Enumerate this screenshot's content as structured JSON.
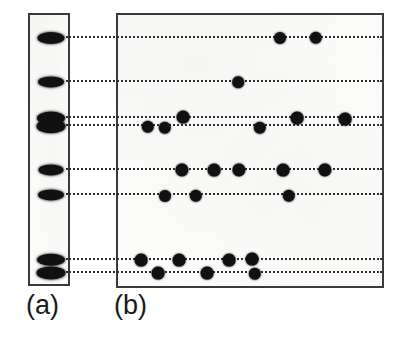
{
  "figure": {
    "type": "gel-electrophoresis-comparison",
    "background_color": "#ffffff",
    "panel_fill": "#fbfbfa",
    "panel_border_color": "#3a3a3a",
    "spot_color": "#111111",
    "trace_color": "#2e2e2e",
    "width": 400,
    "height": 344
  },
  "panels": [
    {
      "key": "a",
      "caption": "(a)",
      "role": "one-dimensional-lane",
      "x": 28,
      "y": 13,
      "width": 42,
      "height": 273
    },
    {
      "key": "b",
      "caption": "(b)",
      "role": "two-dimensional-plate",
      "x": 116,
      "y": 13,
      "width": 268,
      "height": 275
    }
  ],
  "chart_data": {
    "type": "scatter",
    "title": "",
    "subtitle": "",
    "xlabel": "",
    "ylabel": "",
    "grid": false,
    "legend": "none",
    "lane_a": {
      "x_center": 49,
      "bands": [
        {
          "index": 1,
          "y": 36,
          "rx": 13.5,
          "ry": 6.0
        },
        {
          "index": 2,
          "y": 80,
          "rx": 13.0,
          "ry": 5.6
        },
        {
          "index": 3,
          "y": 116,
          "rx": 14.0,
          "ry": 6.4
        },
        {
          "index": 4,
          "y": 124,
          "rx": 14.5,
          "ry": 6.8
        },
        {
          "index": 5,
          "y": 168,
          "rx": 12.5,
          "ry": 5.6
        },
        {
          "index": 6,
          "y": 193,
          "rx": 13.0,
          "ry": 5.6
        },
        {
          "index": 7,
          "y": 258,
          "rx": 14.0,
          "ry": 6.2
        },
        {
          "index": 8,
          "y": 271,
          "rx": 14.5,
          "ry": 6.6
        }
      ]
    },
    "traces": [
      {
        "row": 1,
        "y": 36,
        "x_start": 66,
        "x_end": 382
      },
      {
        "row": 2,
        "y": 80,
        "x_start": 66,
        "x_end": 382
      },
      {
        "row": 3,
        "y": 116,
        "x_start": 66,
        "x_end": 382
      },
      {
        "row": 4,
        "y": 124,
        "x_start": 66,
        "x_end": 382
      },
      {
        "row": 5,
        "y": 168,
        "x_start": 66,
        "x_end": 382
      },
      {
        "row": 6,
        "y": 193,
        "x_start": 66,
        "x_end": 382
      },
      {
        "row": 7,
        "y": 258,
        "x_start": 66,
        "x_end": 382
      },
      {
        "row": 8,
        "y": 271,
        "x_start": 66,
        "x_end": 382
      }
    ],
    "plate_b_spots": [
      {
        "row": 1,
        "x": 278,
        "y": 36,
        "r": 6.0
      },
      {
        "row": 1,
        "x": 314,
        "y": 36,
        "r": 6.2
      },
      {
        "row": 2,
        "x": 236,
        "y": 80,
        "r": 5.8
      },
      {
        "row": 3,
        "x": 181,
        "y": 115,
        "r": 6.4
      },
      {
        "row": 3,
        "x": 295,
        "y": 116,
        "r": 6.4
      },
      {
        "row": 3,
        "x": 343,
        "y": 117,
        "r": 6.4
      },
      {
        "row": 4,
        "x": 146,
        "y": 125,
        "r": 6.2
      },
      {
        "row": 4,
        "x": 163,
        "y": 126,
        "r": 6.2
      },
      {
        "row": 4,
        "x": 258,
        "y": 126,
        "r": 6.2
      },
      {
        "row": 5,
        "x": 180,
        "y": 168,
        "r": 6.6
      },
      {
        "row": 5,
        "x": 212,
        "y": 168,
        "r": 6.4
      },
      {
        "row": 5,
        "x": 237,
        "y": 168,
        "r": 6.6
      },
      {
        "row": 5,
        "x": 281,
        "y": 168,
        "r": 6.4
      },
      {
        "row": 5,
        "x": 323,
        "y": 168,
        "r": 6.6
      },
      {
        "row": 6,
        "x": 163,
        "y": 194,
        "r": 6.0
      },
      {
        "row": 6,
        "x": 194,
        "y": 194,
        "r": 6.2
      },
      {
        "row": 6,
        "x": 287,
        "y": 194,
        "r": 6.2
      },
      {
        "row": 7,
        "x": 139,
        "y": 258,
        "r": 6.4
      },
      {
        "row": 7,
        "x": 177,
        "y": 258,
        "r": 6.4
      },
      {
        "row": 7,
        "x": 227,
        "y": 258,
        "r": 6.4
      },
      {
        "row": 7,
        "x": 250,
        "y": 257,
        "r": 6.4
      },
      {
        "row": 8,
        "x": 156,
        "y": 271,
        "r": 6.4
      },
      {
        "row": 8,
        "x": 205,
        "y": 271,
        "r": 6.4
      },
      {
        "row": 8,
        "x": 253,
        "y": 272,
        "r": 6.2
      }
    ]
  }
}
